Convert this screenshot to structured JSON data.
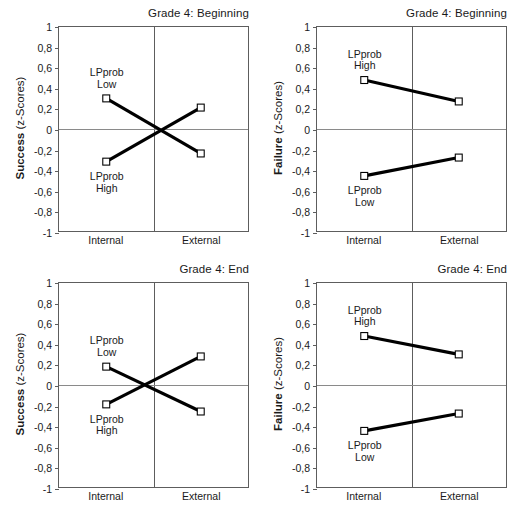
{
  "figure": {
    "y_ticks": [
      "1",
      "0,8",
      "0,6",
      "0,4",
      "0,2",
      "0",
      "-0,2",
      "-0,4",
      "-0,6",
      "-0,8",
      "-1"
    ],
    "x_categories": [
      "Internal",
      "External"
    ],
    "series_label_line1": "LPprob",
    "series_label_high": "High",
    "series_label_low": "Low",
    "axis_color": "#5d5d5d",
    "zero_line_color": "#8a8a8a",
    "line_color": "#000000",
    "marker_fill": "#ffffff"
  },
  "panels": [
    {
      "id": "grade4-beginning-success",
      "title": "Grade 4: Beginning",
      "ylabel_bold": "Success",
      "ylabel_light": " (z-Scores)"
    },
    {
      "id": "grade4-beginning-failure",
      "title": "Grade 4: Beginning",
      "ylabel_bold": "Failure",
      "ylabel_light": " (z-Scores)"
    },
    {
      "id": "grade4-end-success",
      "title": "Grade 4: End",
      "ylabel_bold": "Success",
      "ylabel_light": " (z-Scores)"
    },
    {
      "id": "grade4-end-failure",
      "title": "Grade 4: End",
      "ylabel_bold": "Failure",
      "ylabel_light": " (z-Scores)"
    }
  ],
  "chart_data": [
    {
      "type": "line",
      "title": "Grade 4: Beginning",
      "xlabel": "",
      "ylabel": "Success (z-Scores)",
      "categories": [
        "Internal",
        "External"
      ],
      "ylim": [
        -1,
        1
      ],
      "yticks": [
        1,
        0.8,
        0.6,
        0.4,
        0.2,
        0,
        -0.2,
        -0.4,
        -0.6,
        -0.8,
        -1
      ],
      "grid": false,
      "legend": "inline-annotations",
      "series": [
        {
          "name": "LPprob Low",
          "values": [
            0.3,
            -0.24
          ],
          "label_position": "above-left"
        },
        {
          "name": "LPprob High",
          "values": [
            -0.32,
            0.21
          ],
          "label_position": "below-left"
        }
      ]
    },
    {
      "type": "line",
      "title": "Grade 4: Beginning",
      "xlabel": "",
      "ylabel": "Failure (z-Scores)",
      "categories": [
        "Internal",
        "External"
      ],
      "ylim": [
        -1,
        1
      ],
      "yticks": [
        1,
        0.8,
        0.6,
        0.4,
        0.2,
        0,
        -0.2,
        -0.4,
        -0.6,
        -0.8,
        -1
      ],
      "grid": false,
      "legend": "inline-annotations",
      "series": [
        {
          "name": "LPprob High",
          "values": [
            0.48,
            0.27
          ],
          "label_position": "above-left"
        },
        {
          "name": "LPprob Low",
          "values": [
            -0.46,
            -0.28
          ],
          "label_position": "below-left"
        }
      ]
    },
    {
      "type": "line",
      "title": "Grade 4: End",
      "xlabel": "",
      "ylabel": "Success (z-Scores)",
      "categories": [
        "Internal",
        "External"
      ],
      "ylim": [
        -1,
        1
      ],
      "yticks": [
        1,
        0.8,
        0.6,
        0.4,
        0.2,
        0,
        -0.2,
        -0.4,
        -0.6,
        -0.8,
        -1
      ],
      "grid": false,
      "legend": "inline-annotations",
      "series": [
        {
          "name": "LPprob Low",
          "values": [
            0.18,
            -0.26
          ],
          "label_position": "above-left"
        },
        {
          "name": "LPprob High",
          "values": [
            -0.19,
            0.28
          ],
          "label_position": "below-left"
        }
      ]
    },
    {
      "type": "line",
      "title": "Grade 4: End",
      "xlabel": "",
      "ylabel": "Failure (z-Scores)",
      "categories": [
        "Internal",
        "External"
      ],
      "ylim": [
        -1,
        1
      ],
      "yticks": [
        1,
        0.8,
        0.6,
        0.4,
        0.2,
        0,
        -0.2,
        -0.4,
        -0.6,
        -0.8,
        -1
      ],
      "grid": false,
      "legend": "inline-annotations",
      "series": [
        {
          "name": "LPprob High",
          "values": [
            0.48,
            0.3
          ],
          "label_position": "above-left"
        },
        {
          "name": "LPprob Low",
          "values": [
            -0.45,
            -0.28
          ],
          "label_position": "below-left"
        }
      ]
    }
  ]
}
